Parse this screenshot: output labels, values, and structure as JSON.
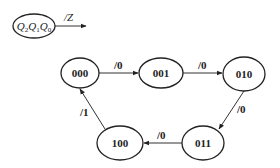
{
  "legend": {
    "state_var_parts": [
      {
        "base": "Q",
        "sub": "2"
      },
      {
        "base": "Q",
        "sub": "1"
      },
      {
        "base": "Q",
        "sub": "0"
      }
    ],
    "output_label": "/Z"
  },
  "states": [
    {
      "id": "s000",
      "label": "000",
      "cx": 80,
      "cy": 73,
      "rx": 19,
      "ry": 15
    },
    {
      "id": "s001",
      "label": "001",
      "cx": 161,
      "cy": 73,
      "rx": 22,
      "ry": 15
    },
    {
      "id": "s010",
      "label": "010",
      "cx": 244,
      "cy": 74,
      "rx": 21,
      "ry": 17
    },
    {
      "id": "s011",
      "label": "011",
      "cx": 203,
      "cy": 143,
      "rx": 21,
      "ry": 17
    },
    {
      "id": "s100",
      "label": "100",
      "cx": 120,
      "cy": 143,
      "rx": 23,
      "ry": 17
    }
  ],
  "transitions": [
    {
      "from": "000",
      "to": "001",
      "label": "/0"
    },
    {
      "from": "001",
      "to": "010",
      "label": "/0"
    },
    {
      "from": "010",
      "to": "011",
      "label": "/0"
    },
    {
      "from": "011",
      "to": "100",
      "label": "/0"
    },
    {
      "from": "100",
      "to": "000",
      "label": "/1"
    }
  ],
  "colors": {
    "stroke": "#222222",
    "background": "#ffffff"
  }
}
